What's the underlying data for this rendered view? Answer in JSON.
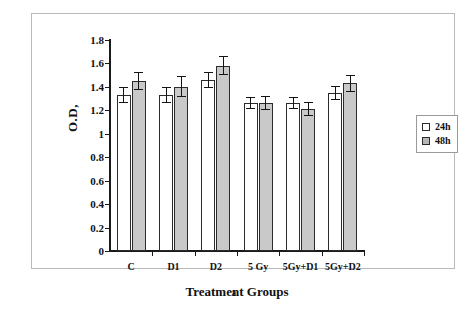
{
  "figure": {
    "caption": "a",
    "background_color": "#ffffff",
    "frame_color": "#b9b9b9"
  },
  "legend": {
    "position": "right",
    "entries": [
      {
        "label": "24h",
        "marker": "square-outline-white",
        "color": "#ffffff"
      },
      {
        "label": "48h",
        "marker": "square-filled-gray",
        "color": "#b6b6b6"
      }
    ]
  },
  "chart_data": {
    "type": "bar",
    "title": "",
    "subtitle": "",
    "xlabel": "Treatment Groups",
    "ylabel": "O.D,",
    "categories": [
      "C",
      "D1",
      "D2",
      "5 Gy",
      "5Gy+D1",
      "5Gy+D2"
    ],
    "series": [
      {
        "name": "24h",
        "color": "#ffffff",
        "values": [
          1.33,
          1.33,
          1.46,
          1.26,
          1.26,
          1.35
        ],
        "errors": [
          0.07,
          0.07,
          0.07,
          0.05,
          0.05,
          0.06
        ]
      },
      {
        "name": "48h",
        "color": "#c9c9c9",
        "values": [
          1.45,
          1.4,
          1.58,
          1.26,
          1.21,
          1.43
        ],
        "errors": [
          0.08,
          0.09,
          0.08,
          0.06,
          0.06,
          0.07
        ]
      }
    ],
    "ylim": [
      0,
      1.8
    ],
    "ytick_step": 0.2,
    "yticks": [
      0,
      0.2,
      0.4,
      0.6,
      0.8,
      1,
      1.2,
      1.4,
      1.6,
      1.8
    ],
    "ytick_labels": [
      "0",
      "0.2",
      "0.4",
      "0.6",
      "0.8",
      "1",
      "1.2",
      "1.4",
      "1.6",
      "1.8"
    ],
    "grid": false,
    "error_bars": true,
    "legend_position": "right"
  }
}
